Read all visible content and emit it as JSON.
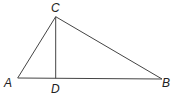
{
  "diagram": {
    "type": "triangle-with-altitude",
    "line_color": "#444444",
    "label_color": "#222222",
    "points": {
      "A": {
        "x": 17.7,
        "y": 78,
        "label": "A",
        "label_x": 5,
        "label_y": 87
      },
      "B": {
        "x": 162,
        "y": 79,
        "label": "B",
        "label_x": 162,
        "label_y": 87
      },
      "C": {
        "x": 55.7,
        "y": 16.7,
        "label": "C",
        "label_x": 51,
        "label_y": 12
      },
      "D": {
        "x": 55.7,
        "y": 78.3,
        "label": "D",
        "label_x": 51,
        "label_y": 92
      }
    },
    "segments": [
      [
        "A",
        "C"
      ],
      [
        "C",
        "B"
      ],
      [
        "A",
        "B"
      ],
      [
        "C",
        "D"
      ]
    ]
  }
}
